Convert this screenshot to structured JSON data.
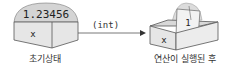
{
  "diagram": {
    "left_box": {
      "variable": "x",
      "value": "1.23456",
      "caption": "초기상태"
    },
    "cast": {
      "label": "(int)"
    },
    "right_box": {
      "variable": "x",
      "value": "1",
      "caption": "연산이 실행된 후"
    },
    "colors": {
      "box_fill": "#e6e6e6",
      "box_top": "#efefef",
      "dome": "#d4d4d4",
      "stroke": "#555555",
      "paper": "#f2f2f2",
      "text": "#222222"
    }
  }
}
